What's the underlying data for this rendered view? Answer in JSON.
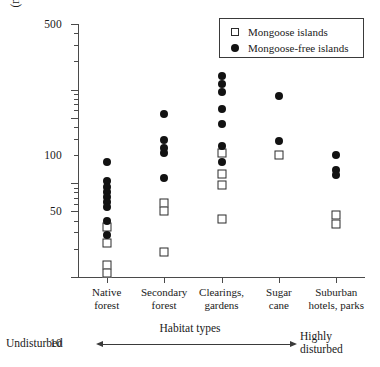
{
  "chart_data": {
    "type": "scatter",
    "title": "",
    "xlabel": "Habitat types",
    "ylabel_line1": "Lizard abundance",
    "ylabel_line2": "(number of diurnal lizards seen per hour)",
    "yscale": "log",
    "ylim": [
      1,
      500
    ],
    "grid": false,
    "ytick_labels": [
      "1",
      "5",
      "10",
      "50",
      "100",
      "500"
    ],
    "ytick_values": [
      1,
      5,
      10,
      50,
      100,
      500
    ],
    "yminor_values": [
      2,
      3,
      4,
      6,
      7,
      8,
      9,
      20,
      30,
      40,
      60,
      70,
      80,
      90,
      200,
      300,
      400
    ],
    "categories": [
      "Native\nforest",
      "Secondary\nforest",
      "Clearings,\ngardens",
      "Sugar\ncane",
      "Suburban\nhotels, parks"
    ],
    "category_labels": [
      [
        "Native",
        "forest"
      ],
      [
        "Secondary",
        "forest"
      ],
      [
        "Clearings,",
        "gardens"
      ],
      [
        "Sugar",
        "cane"
      ],
      [
        "Suburban",
        "hotels, parks"
      ]
    ],
    "legend_position": "top-right",
    "series": [
      {
        "name": "Mongoose islands",
        "marker": "open-square",
        "color": "#2b2b2b",
        "points": [
          {
            "category": 0,
            "value": 3.4
          },
          {
            "category": 0,
            "value": 2.3
          },
          {
            "category": 0,
            "value": 1.35
          },
          {
            "category": 0,
            "value": 1.1
          },
          {
            "category": 1,
            "value": 6.2
          },
          {
            "category": 1,
            "value": 5.1
          },
          {
            "category": 1,
            "value": 1.85
          },
          {
            "category": 2,
            "value": 21
          },
          {
            "category": 2,
            "value": 12.5
          },
          {
            "category": 2,
            "value": 9.5
          },
          {
            "category": 2,
            "value": 4.2
          },
          {
            "category": 3,
            "value": 20
          },
          {
            "category": 4,
            "value": 4.6
          },
          {
            "category": 4,
            "value": 3.7
          }
        ]
      },
      {
        "name": "Mongoose-free islands",
        "marker": "filled-circle",
        "color": "#121212",
        "points": [
          {
            "category": 0,
            "value": 17
          },
          {
            "category": 0,
            "value": 10.5
          },
          {
            "category": 0,
            "value": 9.2
          },
          {
            "category": 0,
            "value": 8.1
          },
          {
            "category": 0,
            "value": 7.2
          },
          {
            "category": 0,
            "value": 6.3
          },
          {
            "category": 0,
            "value": 5.6
          },
          {
            "category": 0,
            "value": 4.0
          },
          {
            "category": 0,
            "value": 2.8
          },
          {
            "category": 1,
            "value": 55
          },
          {
            "category": 1,
            "value": 29
          },
          {
            "category": 1,
            "value": 24
          },
          {
            "category": 1,
            "value": 21
          },
          {
            "category": 1,
            "value": 11.5
          },
          {
            "category": 2,
            "value": 140
          },
          {
            "category": 2,
            "value": 115
          },
          {
            "category": 2,
            "value": 95
          },
          {
            "category": 2,
            "value": 62
          },
          {
            "category": 2,
            "value": 43
          },
          {
            "category": 2,
            "value": 25
          },
          {
            "category": 2,
            "value": 17
          },
          {
            "category": 3,
            "value": 85
          },
          {
            "category": 3,
            "value": 28
          },
          {
            "category": 4,
            "value": 20
          },
          {
            "category": 4,
            "value": 14
          },
          {
            "category": 4,
            "value": 12.2
          }
        ]
      }
    ],
    "annotations": {
      "left_end": [
        "Undisturbed"
      ],
      "right_end": [
        "Highly",
        "disturbed"
      ],
      "axis_caption": "Habitat types"
    }
  }
}
